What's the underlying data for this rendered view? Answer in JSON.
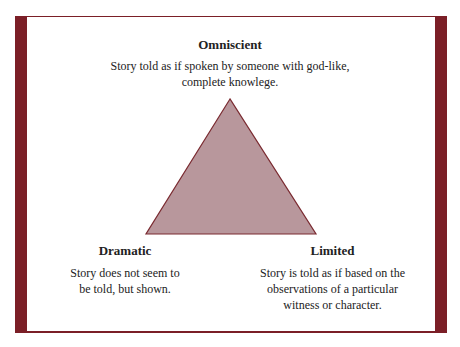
{
  "diagram": {
    "colors": {
      "frame": "#7b1f27",
      "triangle_fill": "#b8979c",
      "triangle_stroke": "#7a2a30"
    },
    "top": {
      "title": "Omniscient",
      "description_line1": "Story told as if spoken by someone with god-like,",
      "description_line2": "complete knowlege."
    },
    "left": {
      "title": "Dramatic",
      "description_line1": "Story does not seem to",
      "description_line2": "be told, but shown."
    },
    "right": {
      "title": "Limited",
      "description_line1": "Story is told as if based on the",
      "description_line2": "observations of a particular",
      "description_line3": "witness or character."
    }
  }
}
